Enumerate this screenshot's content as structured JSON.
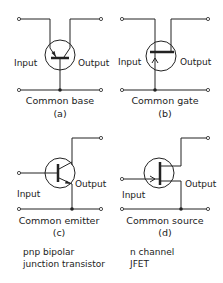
{
  "panels": {
    "a": {
      "input_label": "Input",
      "output_label": "Output",
      "caption": "Common base",
      "letter": "(a)"
    },
    "b": {
      "input_label": "Input",
      "output_label": "Output",
      "caption": "Common gate",
      "letter": "(b)"
    },
    "c": {
      "input_label": "Input",
      "output_label": "Output",
      "caption": "Common emitter",
      "letter": "(c)"
    },
    "d": {
      "input_label": "Input",
      "output_label": "Output",
      "caption": "Common source",
      "letter": "(d)"
    }
  },
  "notes": {
    "left_line1": "pnp bipolar",
    "left_line2": "junction transistor",
    "right_line1": "n channel",
    "right_line2": "JFET"
  },
  "colors": {
    "ink": "#222222",
    "background": "#ffffff"
  }
}
